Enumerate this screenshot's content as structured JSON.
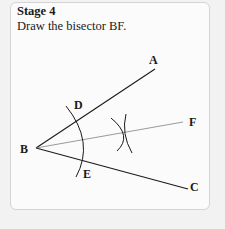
{
  "card": {
    "title": "Stage 4",
    "instruction": "Draw the bisector BF."
  },
  "diagram": {
    "points": {
      "A": "A",
      "B": "B",
      "C": "C",
      "D": "D",
      "E": "E",
      "F": "F"
    },
    "lines": [
      {
        "name": "ray-BA",
        "from": "B",
        "to": "A"
      },
      {
        "name": "ray-BF",
        "from": "B",
        "to": "F",
        "style": "thin-gray"
      },
      {
        "name": "ray-BC",
        "from": "B",
        "to": "C"
      }
    ],
    "arcs": [
      {
        "name": "arc-DE",
        "center": "B",
        "through": [
          "D",
          "E"
        ]
      },
      {
        "name": "arc-from-D",
        "note": "intersecting construction arc"
      },
      {
        "name": "arc-from-E",
        "note": "intersecting construction arc"
      }
    ]
  },
  "colors": {
    "page_background": "#f2f2f2",
    "card_background": "#fbfbfb",
    "card_border": "#d4d4d4",
    "ink": "#1a1a1a",
    "bisector": "#7a7a7a"
  }
}
